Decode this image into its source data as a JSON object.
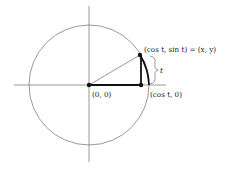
{
  "diagram": {
    "labels": {
      "origin": "(0, 0)",
      "point": "(cos t, sin t) = (x, y)",
      "foot": "(cos t, 0)",
      "arc": "t"
    },
    "geometry": {
      "center": [
        89,
        85
      ],
      "radius": 60,
      "point": [
        140,
        55
      ],
      "foot": [
        141,
        85
      ]
    },
    "colors": {
      "stroke": "#333333",
      "background": "#ffffff"
    }
  }
}
